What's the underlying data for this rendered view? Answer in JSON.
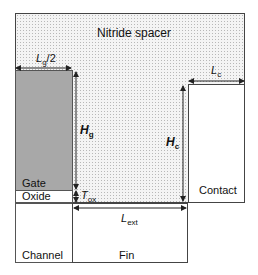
{
  "regions": {
    "spacer": "Nitride spacer",
    "gate": "Gate",
    "oxide": "Oxide",
    "contact": "Contact",
    "channel": "Channel",
    "fin": "Fin"
  },
  "dimensions": {
    "lg_half": {
      "symbol": "L",
      "sub": "g",
      "suffix": "/2"
    },
    "hg": {
      "symbol": "H",
      "sub": "g"
    },
    "hc": {
      "symbol": "H",
      "sub": "c"
    },
    "lc": {
      "symbol": "L",
      "sub": "c"
    },
    "tox": {
      "symbol": "T",
      "sub": "ox"
    },
    "lext": {
      "symbol": "L",
      "sub": "ext"
    }
  },
  "colors": {
    "gate_fill": "#a8a8a8",
    "spacer_fill": "#f4f4f4",
    "line": "#444444"
  }
}
